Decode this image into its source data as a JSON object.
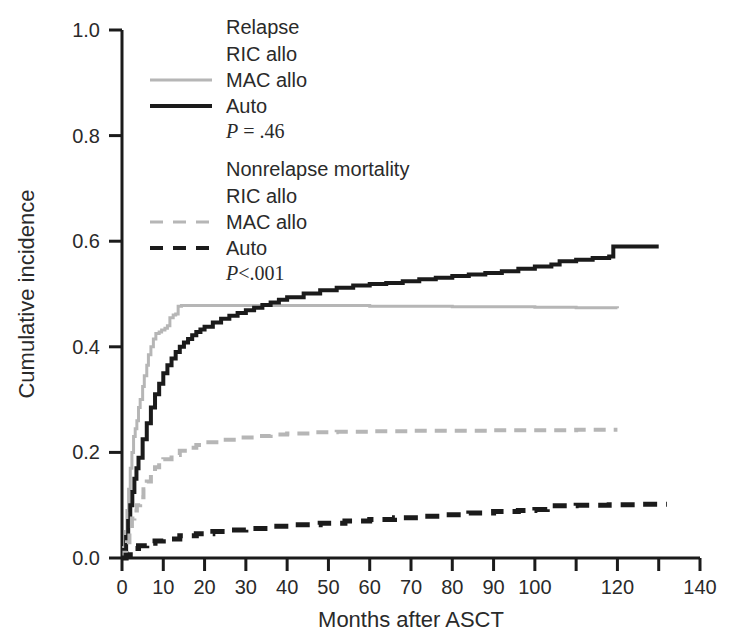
{
  "chart_data": {
    "type": "line",
    "title": "",
    "xlabel": "Months after ASCT",
    "ylabel": "Cumulative incidence",
    "xlim": [
      0,
      140
    ],
    "ylim": [
      0.0,
      1.0
    ],
    "xticks": [
      0,
      10,
      20,
      30,
      40,
      50,
      60,
      70,
      80,
      90,
      100,
      110,
      120,
      130,
      140
    ],
    "xtick_labels": [
      "0",
      "10",
      "20",
      "30",
      "40",
      "50",
      "60",
      "70",
      "80",
      "90",
      "100",
      "",
      "120",
      "",
      "140"
    ],
    "yticks": [
      0.0,
      0.2,
      0.4,
      0.6,
      0.8,
      1.0
    ],
    "ytick_labels": [
      "0.0",
      "0.2",
      "0.4",
      "0.6",
      "0.8",
      "1.0"
    ],
    "grid": false,
    "legend_position": "top-center",
    "series": [
      {
        "name": "Relapse RIC allo",
        "group": "Relapse",
        "label": "RIC allo",
        "color": "#ffffff",
        "style": "solid",
        "width": 3,
        "visible_in_plot": false,
        "points": []
      },
      {
        "name": "Relapse MAC allo",
        "group": "Relapse",
        "label": "MAC allo",
        "color": "#b6b6b6",
        "style": "solid",
        "width": 3,
        "visible_in_plot": true,
        "points": [
          [
            0,
            0.0
          ],
          [
            0.4,
            0.02
          ],
          [
            0.8,
            0.05
          ],
          [
            1.2,
            0.09
          ],
          [
            1.6,
            0.13
          ],
          [
            2.0,
            0.17
          ],
          [
            2.4,
            0.2
          ],
          [
            2.8,
            0.23
          ],
          [
            3.2,
            0.245
          ],
          [
            3.6,
            0.26
          ],
          [
            4.0,
            0.285
          ],
          [
            4.4,
            0.3
          ],
          [
            5.0,
            0.325
          ],
          [
            5.4,
            0.345
          ],
          [
            6.0,
            0.365
          ],
          [
            6.4,
            0.385
          ],
          [
            7.0,
            0.4
          ],
          [
            7.6,
            0.415
          ],
          [
            8.2,
            0.425
          ],
          [
            9.0,
            0.428
          ],
          [
            9.6,
            0.432
          ],
          [
            10.4,
            0.435
          ],
          [
            11.0,
            0.44
          ],
          [
            11.6,
            0.455
          ],
          [
            12.4,
            0.46
          ],
          [
            13.0,
            0.462
          ],
          [
            13.6,
            0.477
          ],
          [
            14.4,
            0.478
          ],
          [
            20,
            0.478
          ],
          [
            40,
            0.478
          ],
          [
            60,
            0.477
          ],
          [
            80,
            0.476
          ],
          [
            100,
            0.475
          ],
          [
            110,
            0.474
          ],
          [
            120,
            0.473
          ]
        ]
      },
      {
        "name": "Relapse Auto",
        "group": "Relapse",
        "label": "Auto",
        "color": "#1b1b1b",
        "style": "solid",
        "width": 4,
        "visible_in_plot": true,
        "points": [
          [
            0,
            0.0
          ],
          [
            0.5,
            0.015
          ],
          [
            1.0,
            0.04
          ],
          [
            1.5,
            0.07
          ],
          [
            2.0,
            0.1
          ],
          [
            2.5,
            0.125
          ],
          [
            3.0,
            0.15
          ],
          [
            3.5,
            0.17
          ],
          [
            4.0,
            0.19
          ],
          [
            5.0,
            0.225
          ],
          [
            6.0,
            0.255
          ],
          [
            7.0,
            0.285
          ],
          [
            8.0,
            0.31
          ],
          [
            9.0,
            0.33
          ],
          [
            10.0,
            0.35
          ],
          [
            11.0,
            0.365
          ],
          [
            12.0,
            0.378
          ],
          [
            13.0,
            0.39
          ],
          [
            14.0,
            0.4
          ],
          [
            15.0,
            0.408
          ],
          [
            16.0,
            0.415
          ],
          [
            17.0,
            0.422
          ],
          [
            18.0,
            0.428
          ],
          [
            19.0,
            0.433
          ],
          [
            20.0,
            0.438
          ],
          [
            22.0,
            0.446
          ],
          [
            24.0,
            0.453
          ],
          [
            26.0,
            0.459
          ],
          [
            28.0,
            0.464
          ],
          [
            30.0,
            0.469
          ],
          [
            32.0,
            0.474
          ],
          [
            34.0,
            0.479
          ],
          [
            36.0,
            0.484
          ],
          [
            38.0,
            0.489
          ],
          [
            40.0,
            0.494
          ],
          [
            44.0,
            0.501
          ],
          [
            48.0,
            0.507
          ],
          [
            52.0,
            0.512
          ],
          [
            56.0,
            0.516
          ],
          [
            60.0,
            0.519
          ],
          [
            64.0,
            0.521
          ],
          [
            68.0,
            0.524
          ],
          [
            72.0,
            0.528
          ],
          [
            76.0,
            0.531
          ],
          [
            80.0,
            0.534
          ],
          [
            84.0,
            0.537
          ],
          [
            88.0,
            0.54
          ],
          [
            92.0,
            0.543
          ],
          [
            96.0,
            0.548
          ],
          [
            100.0,
            0.552
          ],
          [
            104.0,
            0.556
          ],
          [
            106.0,
            0.562
          ],
          [
            110.0,
            0.565
          ],
          [
            114.0,
            0.568
          ],
          [
            118.0,
            0.571
          ],
          [
            119.0,
            0.59
          ],
          [
            130.0,
            0.59
          ]
        ]
      },
      {
        "name": "Nonrelapse mortality RIC allo",
        "group": "Nonrelapse mortality",
        "label": "RIC allo",
        "color": "#ffffff",
        "style": "dashed",
        "width": 3,
        "visible_in_plot": false,
        "points": []
      },
      {
        "name": "Nonrelapse mortality MAC allo",
        "group": "Nonrelapse mortality",
        "label": "MAC allo",
        "color": "#b6b6b6",
        "style": "dashed",
        "width": 4,
        "visible_in_plot": true,
        "points": [
          [
            0,
            0.0
          ],
          [
            0.6,
            0.01
          ],
          [
            1.2,
            0.03
          ],
          [
            1.8,
            0.055
          ],
          [
            2.4,
            0.075
          ],
          [
            3.0,
            0.09
          ],
          [
            3.6,
            0.1
          ],
          [
            4.4,
            0.115
          ],
          [
            5.2,
            0.13
          ],
          [
            6.0,
            0.145
          ],
          [
            7.0,
            0.16
          ],
          [
            8.0,
            0.172
          ],
          [
            9.0,
            0.18
          ],
          [
            10.0,
            0.187
          ],
          [
            12.0,
            0.195
          ],
          [
            14.0,
            0.203
          ],
          [
            16.0,
            0.209
          ],
          [
            18.0,
            0.214
          ],
          [
            20.0,
            0.219
          ],
          [
            24.0,
            0.224
          ],
          [
            28.0,
            0.228
          ],
          [
            32.0,
            0.231
          ],
          [
            36.0,
            0.234
          ],
          [
            40.0,
            0.236
          ],
          [
            46.0,
            0.238
          ],
          [
            52.0,
            0.239
          ],
          [
            60.0,
            0.24
          ],
          [
            70.0,
            0.241
          ],
          [
            80.0,
            0.241
          ],
          [
            90.0,
            0.242
          ],
          [
            100.0,
            0.242
          ],
          [
            110.0,
            0.243
          ],
          [
            120.0,
            0.243
          ]
        ]
      },
      {
        "name": "Nonrelapse mortality Auto",
        "group": "Nonrelapse mortality",
        "label": "Auto",
        "color": "#1b1b1b",
        "style": "dashed",
        "width": 5,
        "visible_in_plot": true,
        "points": [
          [
            0,
            0.0
          ],
          [
            1.0,
            0.005
          ],
          [
            2.0,
            0.012
          ],
          [
            3.0,
            0.018
          ],
          [
            4.0,
            0.023
          ],
          [
            6.0,
            0.028
          ],
          [
            8.0,
            0.032
          ],
          [
            10.0,
            0.036
          ],
          [
            14.0,
            0.042
          ],
          [
            18.0,
            0.046
          ],
          [
            22.0,
            0.05
          ],
          [
            26.0,
            0.053
          ],
          [
            30.0,
            0.056
          ],
          [
            36.0,
            0.06
          ],
          [
            42.0,
            0.063
          ],
          [
            48.0,
            0.066
          ],
          [
            54.0,
            0.07
          ],
          [
            60.0,
            0.073
          ],
          [
            66.0,
            0.076
          ],
          [
            72.0,
            0.079
          ],
          [
            78.0,
            0.082
          ],
          [
            84.0,
            0.085
          ],
          [
            90.0,
            0.088
          ],
          [
            96.0,
            0.09
          ],
          [
            100.0,
            0.092
          ],
          [
            103.0,
            0.094
          ],
          [
            104.0,
            0.099
          ],
          [
            110.0,
            0.1
          ],
          [
            118.0,
            0.101
          ],
          [
            126.0,
            0.102
          ],
          [
            132.0,
            0.102
          ]
        ]
      }
    ]
  },
  "legend": {
    "blocks": [
      {
        "title": "Relapse",
        "entries": [
          {
            "label": "RIC allo",
            "color": "#ffffff",
            "style": "solid"
          },
          {
            "label": "MAC allo",
            "color": "#b6b6b6",
            "style": "solid"
          },
          {
            "label": "Auto",
            "color": "#1b1b1b",
            "style": "solid"
          }
        ],
        "pvalue_prefix": "P",
        "pvalue_rest": " = .46"
      },
      {
        "title": "Nonrelapse mortality",
        "entries": [
          {
            "label": "RIC allo",
            "color": "#ffffff",
            "style": "dashed"
          },
          {
            "label": "MAC allo",
            "color": "#b6b6b6",
            "style": "dashed"
          },
          {
            "label": "Auto",
            "color": "#1b1b1b",
            "style": "dashed"
          }
        ],
        "pvalue_prefix": "P",
        "pvalue_rest": "<.001"
      }
    ]
  },
  "colors": {
    "axis": "#1b1b1b",
    "text": "#2a2a2a",
    "gray_series": "#b6b6b6",
    "black_series": "#1b1b1b",
    "background": "#ffffff"
  },
  "geometry": {
    "plot_left": 122,
    "plot_right": 700,
    "plot_top": 30,
    "plot_bottom": 558
  }
}
